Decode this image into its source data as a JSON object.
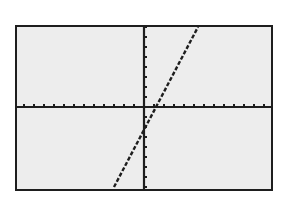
{
  "chart_data": {
    "type": "line",
    "title": "",
    "xlabel": "",
    "ylabel": "",
    "xlim": [
      -13,
      13
    ],
    "ylim": [
      -8,
      8
    ],
    "x_tick_spacing": 1,
    "y_tick_spacing": 1,
    "grid": false,
    "legend": null,
    "series": [
      {
        "name": "line",
        "equation": "y ≈ 2x - 2",
        "x": [
          -3,
          5.4
        ],
        "y": [
          -8,
          8
        ]
      }
    ]
  },
  "colors": {
    "screen_bg": "#ededed",
    "ink": "#1e1e1e",
    "page_bg": "#ffffff"
  }
}
